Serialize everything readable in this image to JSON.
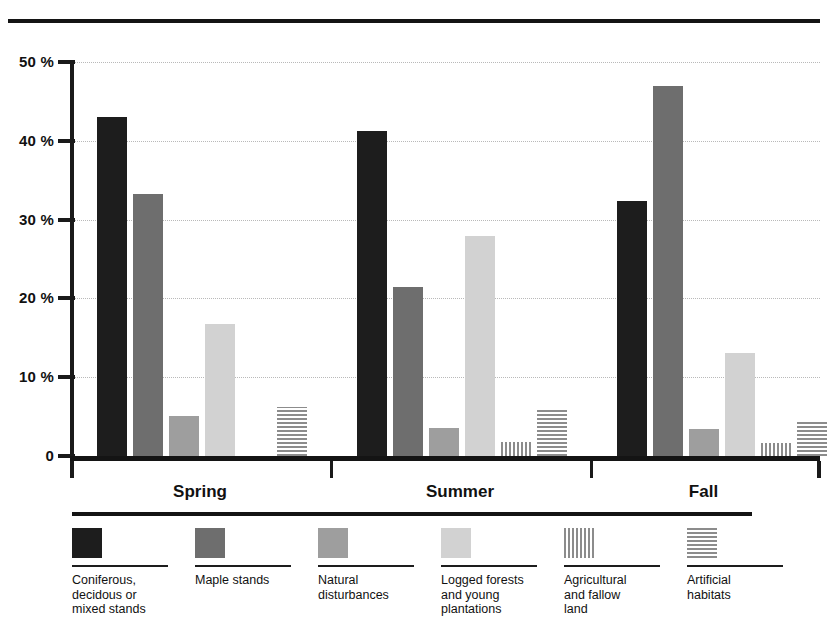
{
  "chart_data": {
    "type": "bar",
    "title": "",
    "xlabel": "",
    "ylabel": "",
    "ylim": [
      0,
      50
    ],
    "ytick_labels": [
      "0",
      "10 %",
      "20 %",
      "30 %",
      "40 %",
      "50 %"
    ],
    "ytick_values": [
      0,
      10,
      20,
      30,
      40,
      50
    ],
    "grid": "horizontal-dotted",
    "legend_position": "bottom",
    "categories": [
      "Spring",
      "Summer",
      "Fall"
    ],
    "series": [
      {
        "name": "Coniferous, decidous or mixed stands",
        "label_lines": "Coniferous,\ndecidous or\nmixed stands",
        "swatch": "solid-black",
        "color": "#1d1d1d",
        "values": [
          43.0,
          41.3,
          32.3
        ]
      },
      {
        "name": "Maple stands",
        "label_lines": "Maple stands",
        "swatch": "solid-dark",
        "color": "#6e6e6e",
        "values": [
          33.3,
          21.4,
          46.9
        ]
      },
      {
        "name": "Natural disturbances",
        "label_lines": "Natural\ndisturbances",
        "swatch": "solid-mid",
        "color": "#9e9e9e",
        "values": [
          5.1,
          3.5,
          3.4
        ]
      },
      {
        "name": "Logged forests and young plantations",
        "label_lines": "Logged forests\nand young\nplantations",
        "swatch": "solid-light",
        "color": "#d2d2d2",
        "values": [
          16.7,
          27.9,
          13.1
        ]
      },
      {
        "name": "Agricultural and fallow land",
        "label_lines": "Agricultural\nand fallow\nland",
        "swatch": "vstripe",
        "color": "#8c8c8c",
        "values": [
          0.0,
          1.8,
          1.6
        ]
      },
      {
        "name": "Artificial habitats",
        "label_lines": "Artificial\nhabitats",
        "swatch": "hstripe",
        "color": "#8c8c8c",
        "values": [
          6.2,
          6.1,
          4.6
        ]
      }
    ]
  }
}
